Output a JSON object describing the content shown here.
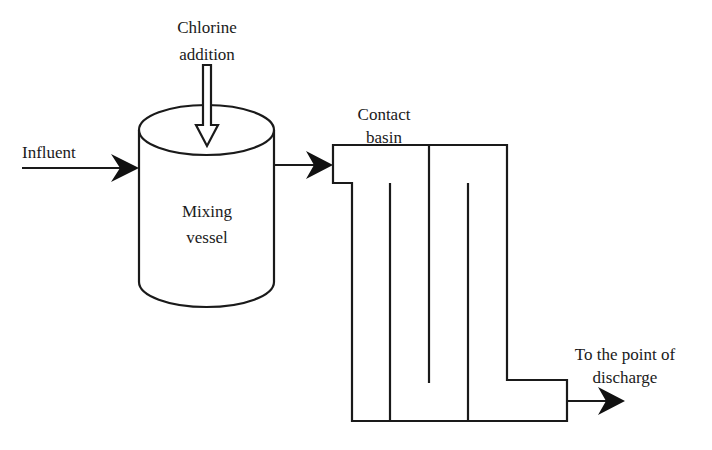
{
  "diagram": {
    "type": "process-flow",
    "labels": {
      "chlorine_line1": "Chlorine",
      "chlorine_line2": "addition",
      "influent": "Influent",
      "mixing_line1": "Mixing",
      "mixing_line2": "vessel",
      "contact_line1": "Contact",
      "contact_line2": "basin",
      "discharge_line1": "To the point of",
      "discharge_line2": "discharge"
    },
    "nodes": [
      {
        "id": "mixing-vessel",
        "label": "Mixing vessel",
        "shape": "cylinder"
      },
      {
        "id": "contact-basin",
        "label": "Contact basin",
        "shape": "serpentine-baffled-tank"
      }
    ],
    "edges": [
      {
        "from": "Influent",
        "to": "mixing-vessel"
      },
      {
        "from": "Chlorine addition",
        "to": "mixing-vessel"
      },
      {
        "from": "mixing-vessel",
        "to": "contact-basin"
      },
      {
        "from": "contact-basin",
        "to": "To the point of discharge"
      }
    ],
    "colors": {
      "stroke": "#1a1a1a",
      "background": "#ffffff"
    }
  }
}
